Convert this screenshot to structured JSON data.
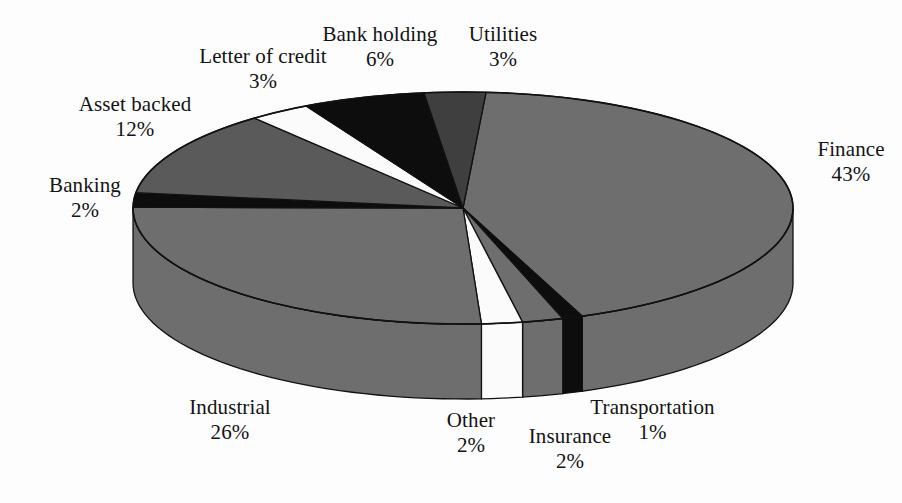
{
  "chart_data": {
    "type": "pie",
    "title": "",
    "subtitle": "",
    "xlabel": "",
    "ylabel": "",
    "three_d": true,
    "legend_position": "none",
    "grid": false,
    "label_format": "name + percent",
    "start_angle_deg": -86,
    "direction": "clockwise",
    "total_percent": 100,
    "categories": [
      "Finance",
      "Transportation",
      "Insurance",
      "Other",
      "Industrial",
      "Banking",
      "Asset backed",
      "Letter of credit",
      "Bank holding",
      "Utilities"
    ],
    "values": [
      43,
      1,
      2,
      2,
      26,
      2,
      12,
      3,
      6,
      3
    ],
    "slices": [
      {
        "name": "Finance",
        "percent": 43,
        "percent_text": "43%",
        "color": "#6e6e6e"
      },
      {
        "name": "Transportation",
        "percent": 1,
        "percent_text": "1%",
        "color": "#0d0d0d"
      },
      {
        "name": "Insurance",
        "percent": 2,
        "percent_text": "2%",
        "color": "#6e6e6e"
      },
      {
        "name": "Other",
        "percent": 2,
        "percent_text": "2%",
        "color": "#fbfbfb"
      },
      {
        "name": "Industrial",
        "percent": 26,
        "percent_text": "26%",
        "color": "#6e6e6e"
      },
      {
        "name": "Banking",
        "percent": 2,
        "percent_text": "2%",
        "color": "#0d0d0d"
      },
      {
        "name": "Asset backed",
        "percent": 12,
        "percent_text": "12%",
        "color": "#5a5a5a"
      },
      {
        "name": "Letter of credit",
        "percent": 3,
        "percent_text": "3%",
        "color": "#fbfbfb"
      },
      {
        "name": "Bank holding",
        "percent": 6,
        "percent_text": "6%",
        "color": "#0d0d0d"
      },
      {
        "name": "Utilities",
        "percent": 3,
        "percent_text": "3%",
        "color": "#3f3f3f"
      }
    ]
  },
  "labels": {
    "finance": {
      "name": "Finance",
      "value": "43%"
    },
    "transportation": {
      "name": "Transportation",
      "value": "1%"
    },
    "insurance": {
      "name": "Insurance",
      "value": "2%"
    },
    "other": {
      "name": "Other",
      "value": "2%"
    },
    "industrial": {
      "name": "Industrial",
      "value": "26%"
    },
    "banking": {
      "name": "Banking",
      "value": "2%"
    },
    "asset_backed": {
      "name": "Asset backed",
      "value": "12%"
    },
    "letter_of_credit": {
      "name": "Letter of credit",
      "value": "3%"
    },
    "bank_holding": {
      "name": "Bank holding",
      "value": "6%"
    },
    "utilities": {
      "name": "Utilities",
      "value": "3%"
    }
  },
  "colors": {
    "background": "#fdfdfd",
    "text": "#131313",
    "outline": "#111111",
    "gray_main": "#6e6e6e",
    "gray_mid": "#5a5a5a",
    "gray_dark": "#3f3f3f",
    "black": "#0d0d0d",
    "white": "#fbfbfb"
  },
  "geometry": {
    "center_x": 463,
    "center_y": 208,
    "radius_x": 330,
    "radius_y": 116,
    "depth": 75
  }
}
